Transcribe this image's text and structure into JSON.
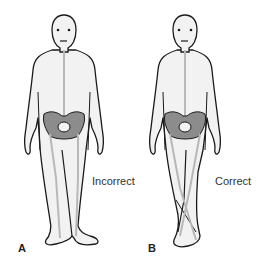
{
  "figure": {
    "panels": [
      {
        "letter": "A",
        "caption": "Incorrect"
      },
      {
        "letter": "B",
        "caption": "Correct"
      }
    ],
    "colors": {
      "skin": "#f2f2f2",
      "outline": "#1a1a1a",
      "pelvis": "#8c8c8c",
      "axis_line": "#b8b8b8"
    }
  }
}
